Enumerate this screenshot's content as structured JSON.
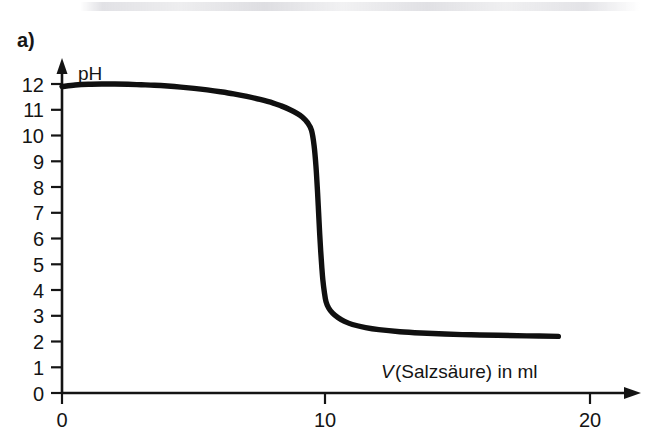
{
  "figure": {
    "panel_label": "a)",
    "background_color": "#ffffff",
    "ink_color": "#141414"
  },
  "chart_data": {
    "type": "line",
    "title": "",
    "subtitle": "",
    "xlabel_parts": {
      "symbol": "V",
      "rest": " (Salzsäure) in ml"
    },
    "xlabel": "V (Salzsäure) in ml",
    "ylabel": "pH",
    "xlim": [
      0,
      22
    ],
    "ylim": [
      0,
      12.6
    ],
    "grid": false,
    "legend": null,
    "x_ticks": [
      0,
      10,
      20
    ],
    "x_tick_labels": [
      "0",
      "10",
      "20"
    ],
    "y_ticks": [
      0,
      1,
      2,
      3,
      4,
      5,
      6,
      7,
      8,
      9,
      10,
      11,
      12
    ],
    "y_tick_labels": [
      "0",
      "1",
      "2",
      "3",
      "4",
      "5",
      "6",
      "7",
      "8",
      "9",
      "10",
      "11",
      "12"
    ],
    "x": [
      0.0,
      0.5,
      1.0,
      1.5,
      2.0,
      2.5,
      3.0,
      3.5,
      4.0,
      4.5,
      5.0,
      5.5,
      6.0,
      6.5,
      7.0,
      7.5,
      8.0,
      8.3,
      8.6,
      8.9,
      9.1,
      9.3,
      9.45,
      9.55,
      9.62,
      9.68,
      9.72,
      9.76,
      9.8,
      9.84,
      9.88,
      9.94,
      10.0,
      10.1,
      10.25,
      10.45,
      10.7,
      11.0,
      11.5,
      12.0,
      12.8,
      13.6,
      14.5,
      15.5,
      16.5,
      17.6,
      18.8
    ],
    "y": [
      11.9,
      11.96,
      11.99,
      12.0,
      12.0,
      11.99,
      11.97,
      11.95,
      11.92,
      11.88,
      11.83,
      11.77,
      11.7,
      11.62,
      11.52,
      11.4,
      11.26,
      11.15,
      11.02,
      10.86,
      10.72,
      10.5,
      10.2,
      9.6,
      8.8,
      7.8,
      7.0,
      6.2,
      5.5,
      4.9,
      4.4,
      3.9,
      3.55,
      3.3,
      3.1,
      2.93,
      2.78,
      2.66,
      2.54,
      2.46,
      2.38,
      2.33,
      2.29,
      2.26,
      2.24,
      2.22,
      2.2
    ],
    "annotations": [
      {
        "name": "equivalence-point",
        "x": 9.8,
        "y": 7.0,
        "label": ""
      }
    ],
    "series": [
      {
        "name": "Titrationskurve",
        "color": "#101010",
        "line_width": 5.4,
        "marker": "none"
      }
    ],
    "axis_style": {
      "x_axis_arrow": true,
      "y_axis_arrow": true,
      "spines": [
        "left",
        "bottom"
      ]
    }
  }
}
